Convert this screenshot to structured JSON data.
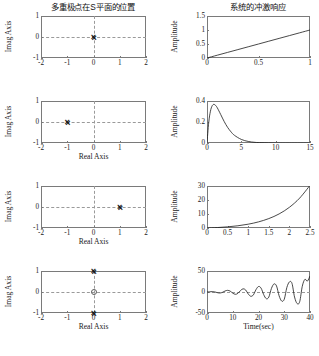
{
  "figure": {
    "title_left": "多重极点在S平面的位置",
    "title_right": "系统的冲激响应",
    "background": "#ffffff",
    "line_color": "#1a1a1a",
    "axis_color": "#7a7a7a",
    "grid_color": "#9a9a9a"
  },
  "labels": {
    "imag_axis": "Imag Axis",
    "real_axis": "Real Axis",
    "amplitude": "Amplitude",
    "time_sec": "Time(sec)",
    "marker_pole": "×",
    "marker_zero": "o"
  },
  "chart_data": [
    {
      "id": "pz-row1",
      "type": "scatter",
      "title": "多重极点在S平面的位置",
      "xlabel": "",
      "ylabel": "Imag Axis",
      "xlim": [
        -2,
        2
      ],
      "ylim": [
        -1,
        1
      ],
      "xticks": [
        -2,
        -1,
        0,
        1,
        2
      ],
      "xticklabels": [
        "-2",
        "-1",
        "0",
        "1",
        "2"
      ],
      "yticks": [
        -1,
        0,
        1
      ],
      "yticklabels": [
        "-1",
        "0",
        "1"
      ],
      "grid": true,
      "poles": [
        {
          "re": 0,
          "im": 0,
          "multiplicity": 2
        }
      ],
      "zeros": []
    },
    {
      "id": "imp-row1",
      "type": "line",
      "title": "系统的冲激响应",
      "xlabel": "",
      "ylabel": "Amplitude",
      "xlim": [
        0,
        1
      ],
      "ylim": [
        0,
        1.5
      ],
      "xticks": [
        0,
        0.5,
        1
      ],
      "xticklabels": [
        "0",
        "0.5",
        "1"
      ],
      "yticks": [
        0,
        0.5,
        1,
        1.5
      ],
      "yticklabels": [
        "0",
        "0.5",
        "1",
        "1.5"
      ],
      "grid": false,
      "x": [
        0,
        0.1,
        0.2,
        0.3,
        0.4,
        0.5,
        0.6,
        0.7,
        0.8,
        0.9,
        1.0
      ],
      "y": [
        0,
        0.1,
        0.2,
        0.3,
        0.4,
        0.5,
        0.6,
        0.7,
        0.8,
        0.9,
        1.0
      ]
    },
    {
      "id": "pz-row2",
      "type": "scatter",
      "title": "",
      "xlabel": "Real Axis",
      "ylabel": "Imag Axis",
      "xlim": [
        -2,
        2
      ],
      "ylim": [
        -1,
        1
      ],
      "xticks": [
        -2,
        -1,
        0,
        1,
        2
      ],
      "xticklabels": [
        "-2",
        "-1",
        "0",
        "1",
        "2"
      ],
      "yticks": [
        -1,
        0,
        1
      ],
      "yticklabels": [
        "-1",
        "0",
        "1"
      ],
      "grid": true,
      "poles": [
        {
          "re": -1,
          "im": 0,
          "multiplicity": 2
        }
      ],
      "zeros": []
    },
    {
      "id": "imp-row2",
      "type": "line",
      "title": "",
      "xlabel": "",
      "ylabel": "Amplitude",
      "xlim": [
        0,
        15
      ],
      "ylim": [
        0,
        0.4
      ],
      "xticks": [
        0,
        5,
        10,
        15
      ],
      "xticklabels": [
        "0",
        "5",
        "10",
        "15"
      ],
      "yticks": [
        0,
        0.2,
        0.4
      ],
      "yticklabels": [
        "0",
        "0.2",
        "0.4"
      ],
      "grid": false,
      "x": [
        0,
        0.25,
        0.5,
        0.75,
        1.0,
        1.25,
        1.5,
        2.0,
        2.5,
        3.0,
        3.5,
        4.0,
        5.0,
        6.0,
        7.0,
        8.0,
        10.0,
        12.0,
        15.0
      ],
      "y": [
        0,
        0.195,
        0.303,
        0.354,
        0.368,
        0.358,
        0.335,
        0.271,
        0.205,
        0.149,
        0.106,
        0.073,
        0.034,
        0.015,
        0.006,
        0.003,
        0.0005,
        0.0001,
        0.0
      ]
    },
    {
      "id": "pz-row3",
      "type": "scatter",
      "title": "",
      "xlabel": "Real Axis",
      "ylabel": "Imag Axis",
      "xlim": [
        -2,
        2
      ],
      "ylim": [
        -1,
        1
      ],
      "xticks": [
        -2,
        -1,
        0,
        1,
        2
      ],
      "xticklabels": [
        "-2",
        "-1",
        "0",
        "1",
        "2"
      ],
      "yticks": [
        -1,
        0,
        1
      ],
      "yticklabels": [
        "-1",
        "0",
        "1"
      ],
      "grid": true,
      "poles": [
        {
          "re": 1,
          "im": 0,
          "multiplicity": 2
        }
      ],
      "zeros": []
    },
    {
      "id": "imp-row3",
      "type": "line",
      "title": "",
      "xlabel": "",
      "ylabel": "Amplitude",
      "xlim": [
        0,
        2.5
      ],
      "ylim": [
        0,
        30
      ],
      "xticks": [
        0,
        0.5,
        1,
        1.5,
        2,
        2.5
      ],
      "xticklabels": [
        "0",
        "0.5",
        "1",
        "1.5",
        "2",
        "2.5"
      ],
      "yticks": [
        0,
        10,
        20,
        30
      ],
      "yticklabels": [
        "0",
        "10",
        "20",
        "30"
      ],
      "grid": false,
      "x": [
        0,
        0.25,
        0.5,
        0.75,
        1.0,
        1.25,
        1.5,
        1.75,
        2.0,
        2.25,
        2.5
      ],
      "y": [
        0,
        0.32,
        0.82,
        1.59,
        2.72,
        4.37,
        6.72,
        10.05,
        14.78,
        21.39,
        30.46
      ]
    },
    {
      "id": "pz-row4",
      "type": "scatter",
      "title": "",
      "xlabel": "Real Axis",
      "ylabel": "Imag Axis",
      "xlim": [
        -2,
        2
      ],
      "ylim": [
        -1,
        1
      ],
      "xticks": [
        -2,
        -1,
        0,
        1,
        2
      ],
      "xticklabels": [
        "-2",
        "-1",
        "0",
        "1",
        "2"
      ],
      "yticks": [
        -1,
        0,
        1
      ],
      "yticklabels": [
        "-1",
        "0",
        "1"
      ],
      "grid": true,
      "poles": [
        {
          "re": 0,
          "im": 1,
          "multiplicity": 2
        },
        {
          "re": 0,
          "im": -1,
          "multiplicity": 2
        }
      ],
      "zeros": [
        {
          "re": 0,
          "im": 0
        }
      ]
    },
    {
      "id": "imp-row4",
      "type": "line",
      "title": "",
      "xlabel": "Time(sec)",
      "ylabel": "Amplitude",
      "xlim": [
        0,
        40
      ],
      "ylim": [
        -50,
        50
      ],
      "xticks": [
        0,
        10,
        20,
        30,
        40
      ],
      "xticklabels": [
        "0",
        "10",
        "20",
        "30",
        "40"
      ],
      "yticks": [
        -50,
        0,
        50
      ],
      "yticklabels": [
        "-50",
        "0",
        "50"
      ],
      "grid": true,
      "description": "t*sin(t)/2 growing oscillation",
      "x": [
        0,
        1,
        2,
        3,
        4,
        5,
        6,
        7,
        8,
        9,
        10,
        11,
        12,
        13,
        14,
        15,
        16,
        17,
        18,
        19,
        20,
        21,
        22,
        23,
        24,
        25,
        26,
        27,
        28,
        29,
        30,
        31,
        32,
        33,
        34,
        35,
        36,
        37,
        38,
        39,
        40
      ],
      "y": [
        0,
        0.42,
        0.91,
        0.21,
        -1.51,
        -2.4,
        -0.84,
        2.3,
        3.96,
        2.06,
        -2.72,
        -5.5,
        -3.22,
        3.38,
        7.57,
        4.88,
        -4.59,
        -10.18,
        -7.0,
        5.39,
        13.1,
        9.2,
        -6.0,
        -15.9,
        -12.2,
        8.2,
        19.1,
        14.4,
        -9.0,
        -21.5,
        -17.3,
        10.5,
        24.0,
        20.6,
        -12.0,
        -27.5,
        -23.0,
        13.5,
        30.0,
        26.0,
        38.0
      ]
    }
  ]
}
